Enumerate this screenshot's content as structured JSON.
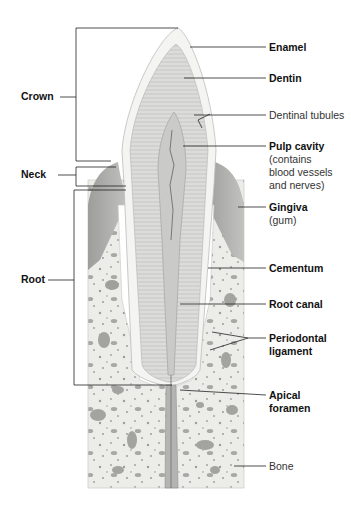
{
  "diagram": {
    "type": "anatomical-cross-section",
    "colors": {
      "background": "#ffffff",
      "enamel": "#f4f4f2",
      "dentin": "#dcdcda",
      "pulp": "#c9c9c7",
      "gingiva": "#a9a9a7",
      "bone": "#ecece9",
      "bone_spots": "#a6a6a3",
      "ligament": "#ffffff",
      "leader_line": "#222222"
    },
    "left_labels": [
      {
        "id": "crown",
        "text": "Crown"
      },
      {
        "id": "neck",
        "text": "Neck"
      },
      {
        "id": "root",
        "text": "Root"
      }
    ],
    "right_labels": [
      {
        "id": "enamel",
        "text": "Enamel",
        "sub": ""
      },
      {
        "id": "dentin",
        "text": "Dentin",
        "sub": ""
      },
      {
        "id": "dentinal-tubules",
        "text": "Dentinal tubules",
        "sub": ""
      },
      {
        "id": "pulp-cavity",
        "text": "Pulp cavity",
        "sub1": "(contains",
        "sub2": "blood vessels",
        "sub3": "and nerves)"
      },
      {
        "id": "gingiva",
        "text": "Gingiva",
        "sub": "(gum)"
      },
      {
        "id": "cementum",
        "text": "Cementum",
        "sub": ""
      },
      {
        "id": "root-canal",
        "text": "Root canal",
        "sub": ""
      },
      {
        "id": "periodontal-ligament",
        "text": "Periodontal",
        "sub": "ligament"
      },
      {
        "id": "apical-foramen",
        "text": "Apical",
        "sub": "foramen"
      },
      {
        "id": "bone",
        "text": "Bone",
        "sub": ""
      }
    ]
  }
}
